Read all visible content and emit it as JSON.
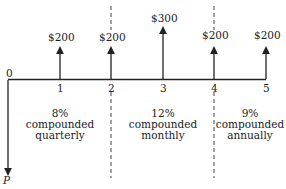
{
  "diagram": {
    "type": "cash-flow-timeline",
    "origin_label": "0",
    "periods": [
      "1",
      "2",
      "3",
      "4",
      "5"
    ],
    "cash_flows": [
      {
        "period": "1",
        "amount": "$200"
      },
      {
        "period": "2",
        "amount": "$200"
      },
      {
        "period": "3",
        "amount": "$300"
      },
      {
        "period": "4",
        "amount": "$200"
      },
      {
        "period": "5",
        "amount": "$200"
      }
    ],
    "present_value_label": "P",
    "segments": [
      {
        "rate": "8%",
        "line2": "compounded",
        "line3": "quarterly"
      },
      {
        "rate": "12%",
        "line2": "compounded",
        "line3": "monthly"
      },
      {
        "rate": "9%",
        "line2": "compounded",
        "line3": "annually"
      }
    ]
  }
}
